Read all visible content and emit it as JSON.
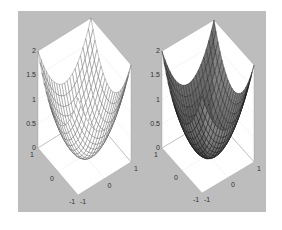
{
  "figure": {
    "background": "#bdbdbd",
    "pane_color": "#ffffff"
  },
  "chart_data": [
    {
      "type": "surface",
      "render": "mesh",
      "title": "",
      "function": "z = x^2 + y^2",
      "x_range": [
        -1,
        1
      ],
      "y_range": [
        -1,
        1
      ],
      "zlim": [
        0,
        2
      ],
      "grid_n": 21,
      "face_color": "#ffffff",
      "edge_color": "#555555",
      "ztick_labels": [
        "0",
        "0.5",
        "1",
        "1.5",
        "2"
      ],
      "xtick_labels": [
        "-1",
        "0",
        "1"
      ],
      "ytick_labels": [
        "-1",
        "0",
        "1"
      ],
      "box": {
        "top": [
          90,
          18
        ],
        "left": [
          38,
          51
        ],
        "right": [
          131,
          64
        ],
        "left_floor": [
          38,
          148
        ],
        "bottom": [
          78,
          195
        ],
        "right_floor": [
          131,
          162
        ],
        "back_floor": [
          90,
          115
        ]
      }
    },
    {
      "type": "surface",
      "render": "shaded",
      "title": "",
      "function": "z = x^2 + y^2",
      "x_range": [
        -1,
        1
      ],
      "y_range": [
        -1,
        1
      ],
      "zlim": [
        0,
        2
      ],
      "grid_n": 21,
      "face_color": "#3a3a3a",
      "edge_color": "#111111",
      "ztick_labels": [
        "0",
        "0.5",
        "1",
        "1.5",
        "2"
      ],
      "xtick_labels": [
        "-1",
        "0",
        "1"
      ],
      "ytick_labels": [
        "-1",
        "0",
        "1"
      ],
      "box": {
        "top": [
          214,
          18
        ],
        "left": [
          162,
          51
        ],
        "right": [
          254,
          64
        ],
        "left_floor": [
          162,
          148
        ],
        "bottom": [
          202,
          193
        ],
        "right_floor": [
          254,
          162
        ],
        "back_floor": [
          214,
          115
        ]
      }
    }
  ]
}
